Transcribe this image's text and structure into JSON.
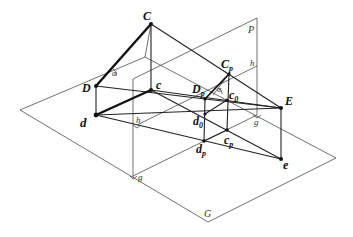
{
  "diagram": {
    "title": "",
    "planes": {
      "ground": {
        "label": "G",
        "corners": [
          [
            20,
            110
          ],
          [
            145,
            57
          ],
          [
            336,
            158
          ],
          [
            208,
            222
          ]
        ]
      },
      "projection": {
        "label": "P",
        "top_left": [
          133,
          79
        ],
        "top_right": [
          257,
          18
        ],
        "bottom_right": [
          257,
          115
        ],
        "bottom_left": [
          133,
          177
        ]
      }
    },
    "points": {
      "C": {
        "label": "C",
        "x": 151,
        "y": 24
      },
      "D": {
        "label": "D",
        "x": 96,
        "y": 86
      },
      "c": {
        "label": "c",
        "x": 151,
        "y": 90
      },
      "d": {
        "label": "d",
        "x": 96,
        "y": 115
      },
      "E": {
        "label": "E",
        "x": 281,
        "y": 108
      },
      "e": {
        "label": "e",
        "x": 281,
        "y": 159
      },
      "Cp": {
        "label": "C",
        "sub": "p",
        "x": 229,
        "y": 74
      },
      "Dp": {
        "label": "D",
        "sub": "p",
        "x": 205,
        "y": 99
      },
      "c0": {
        "label": "c",
        "sub": "0",
        "x": 227,
        "y": 100
      },
      "d0": {
        "label": "d",
        "sub": "0",
        "x": 205,
        "y": 114
      },
      "cp": {
        "label": "c",
        "sub": "p",
        "x": 227,
        "y": 130
      },
      "dp": {
        "label": "d",
        "sub": "p",
        "x": 204,
        "y": 141
      }
    },
    "labels": {
      "C": "C",
      "D": "D",
      "c": "c",
      "d": "d",
      "E": "E",
      "e": "e",
      "Cp_main": "C",
      "Cp_sub": "p",
      "Dp_main": "D",
      "Dp_sub": "p",
      "c0_main": "c",
      "c0_sub": "0",
      "d0_main": "d",
      "d0_sub": "0",
      "cp_main": "c",
      "cp_sub": "p",
      "dp_main": "d",
      "dp_sub": "p",
      "P": "P",
      "G": "G",
      "h_right": "h",
      "h_left": "h",
      "g_right": "g",
      "g_left": "g",
      "alpha_left": "α",
      "alpha_right": "α"
    }
  }
}
